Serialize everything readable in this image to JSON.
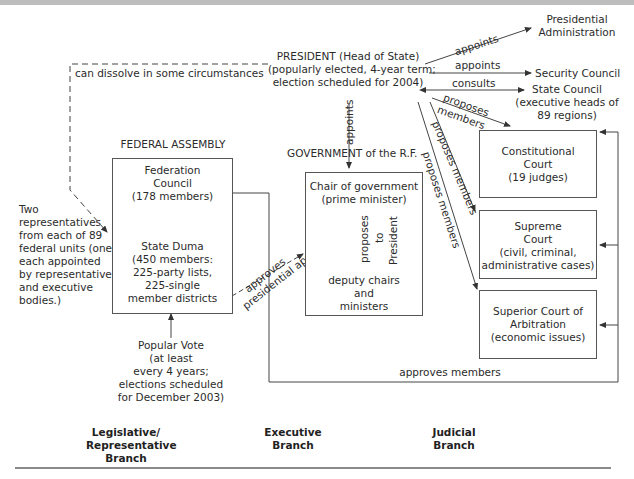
{
  "president": {
    "line1": "PRESIDENT (Head of State)",
    "line2": "(popularly elected, 4-year term;",
    "line3": "election scheduled for 2004)"
  },
  "presidential_links": {
    "appoints_admin": "appoints",
    "appoints_security": "appoints",
    "consults": "consults",
    "proposes_members_1": "proposes",
    "proposes_members_1b": "members",
    "proposes_members_2": "proposes members",
    "proposes_members_3": "proposes members",
    "appoints_government": "appoints",
    "can_dissolve": "can dissolve in some circumstances"
  },
  "bodies": {
    "presidential_admin": {
      "line1": "Presidential",
      "line2": "Administration"
    },
    "security_council": "Security Council",
    "state_council": {
      "line1": "State Council",
      "line2": "(executive heads of",
      "line3": "89 regions)"
    }
  },
  "legislative": {
    "heading": "FEDERAL ASSEMBLY",
    "federation_council": {
      "line1": "Federation",
      "line2": "Council",
      "line3": "(178 members)"
    },
    "state_duma": {
      "line1": "State Duma",
      "line2": "(450 members:",
      "line3": "225-party lists,",
      "line4": "225-single",
      "line5": "member districts"
    },
    "two_reps": [
      "Two",
      "representatives",
      "from each of 89",
      "federal units (one",
      "each appointed",
      "by representative",
      "and executive",
      "bodies.)"
    ],
    "popular_vote": [
      "Popular Vote",
      "(at least",
      "every 4 years;",
      "elections scheduled",
      "for December 2003)"
    ],
    "approves": "approves",
    "presidential_appointee": "presidential appointee",
    "approves_members": "approves members"
  },
  "executive": {
    "heading": "GOVERNMENT of the R.F.",
    "chair": {
      "line1": "Chair of government",
      "line2": "(prime minister)"
    },
    "proposes": "proposes",
    "to": "to",
    "president": "President",
    "deputies": {
      "line1": "deputy chairs",
      "line2": "and",
      "line3": "ministers"
    }
  },
  "judicial": {
    "constitutional": {
      "line1": "Constitutional",
      "line2": "Court",
      "line3": "(19 judges)"
    },
    "supreme": {
      "line1": "Supreme",
      "line2": "Court",
      "line3": "(civil, criminal,",
      "line4": "administrative cases)"
    },
    "arbitration": {
      "line1": "Superior Court of",
      "line2": "Arbitration",
      "line3": "(economic issues)"
    }
  },
  "branches": {
    "legislative": {
      "line1": "Legislative/",
      "line2": "Representative",
      "line3": "Branch"
    },
    "executive": {
      "line1": "Executive",
      "line2": "Branch"
    },
    "judicial": {
      "line1": "Judicial",
      "line2": "Branch"
    }
  },
  "colors": {
    "line": "#444444",
    "box_border": "#555555",
    "text": "#2b2b2b",
    "rule": "#bdbdbd"
  }
}
